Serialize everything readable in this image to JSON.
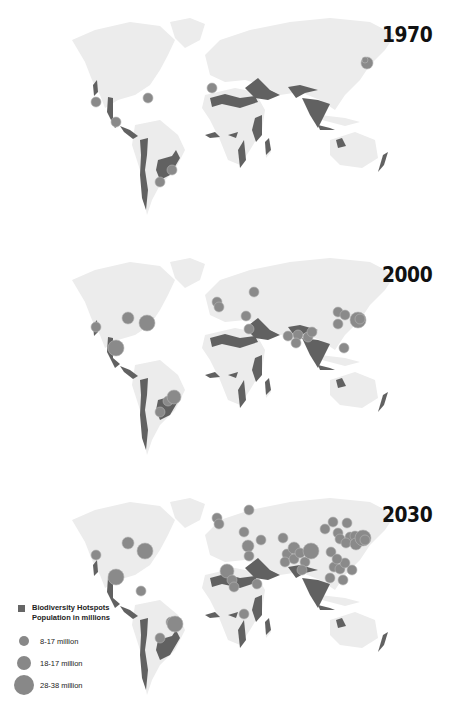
{
  "colors": {
    "land": "#ececec",
    "hotspot": "#616161",
    "circle": "#8a8a8a",
    "circle_stroke": "#b5b5b5",
    "year_text": "#111111"
  },
  "panels": [
    {
      "year": "1970",
      "top": 0,
      "circles": [
        [
          96,
          102,
          5
        ],
        [
          148,
          98,
          5
        ],
        [
          116,
          122,
          5
        ],
        [
          212,
          88,
          5
        ],
        [
          172,
          170,
          5
        ],
        [
          160,
          182,
          5
        ],
        [
          367,
          63,
          6
        ],
        [
          365,
          60,
          3
        ]
      ]
    },
    {
      "year": "2000",
      "top": 240,
      "circles": [
        [
          96,
          87,
          5
        ],
        [
          128,
          78,
          6
        ],
        [
          147,
          83,
          8
        ],
        [
          116,
          108,
          8
        ],
        [
          168,
          161,
          5
        ],
        [
          174,
          157,
          7
        ],
        [
          160,
          172,
          5
        ],
        [
          217,
          62,
          5
        ],
        [
          219,
          67,
          5
        ],
        [
          254,
          52,
          5
        ],
        [
          246,
          76,
          5
        ],
        [
          249,
          89,
          5
        ],
        [
          288,
          96,
          5
        ],
        [
          298,
          95,
          5
        ],
        [
          296,
          103,
          5
        ],
        [
          308,
          97,
          5
        ],
        [
          338,
          72,
          5
        ],
        [
          345,
          75,
          5
        ],
        [
          338,
          84,
          5
        ],
        [
          358,
          80,
          8
        ],
        [
          360,
          79,
          5
        ],
        [
          344,
          108,
          5
        ],
        [
          312,
          92,
          5
        ]
      ]
    },
    {
      "year": "2030",
      "top": 480,
      "circles": [
        [
          96,
          75,
          5
        ],
        [
          128,
          63,
          6
        ],
        [
          145,
          71,
          8
        ],
        [
          116,
          97,
          8
        ],
        [
          141,
          111,
          5
        ],
        [
          171,
          142,
          5
        ],
        [
          175,
          144,
          8
        ],
        [
          160,
          158,
          5
        ],
        [
          217,
          38,
          5
        ],
        [
          219,
          44,
          5
        ],
        [
          249,
          30,
          5
        ],
        [
          244,
          52,
          5
        ],
        [
          248,
          66,
          6
        ],
        [
          249,
          76,
          5
        ],
        [
          227,
          91,
          7
        ],
        [
          232,
          100,
          5
        ],
        [
          234,
          107,
          5
        ],
        [
          244,
          134,
          5
        ],
        [
          257,
          104,
          5
        ],
        [
          261,
          60,
          5
        ],
        [
          283,
          58,
          5
        ],
        [
          287,
          74,
          5
        ],
        [
          285,
          82,
          5
        ],
        [
          294,
          68,
          6
        ],
        [
          294,
          79,
          5
        ],
        [
          300,
          73,
          5
        ],
        [
          305,
          82,
          5
        ],
        [
          311,
          71,
          8
        ],
        [
          302,
          90,
          5
        ],
        [
          325,
          49,
          5
        ],
        [
          333,
          42,
          5
        ],
        [
          338,
          53,
          5
        ],
        [
          347,
          43,
          5
        ],
        [
          350,
          57,
          5
        ],
        [
          340,
          59,
          5
        ],
        [
          355,
          56,
          5
        ],
        [
          346,
          63,
          5
        ],
        [
          356,
          64,
          6
        ],
        [
          363,
          58,
          8
        ],
        [
          365,
          60,
          5
        ],
        [
          331,
          72,
          5
        ],
        [
          334,
          87,
          5
        ],
        [
          330,
          98,
          5
        ],
        [
          343,
          100,
          5
        ],
        [
          340,
          89,
          5
        ],
        [
          345,
          83,
          5
        ],
        [
          337,
          79,
          5
        ],
        [
          352,
          90,
          5
        ]
      ]
    }
  ],
  "legend": {
    "title_line1": "Biodiversity Hotspots",
    "title_line2": "Population in millions",
    "items": [
      {
        "label": "8-17 million",
        "size": 10
      },
      {
        "label": "18-17 million",
        "size": 14
      },
      {
        "label": "28-38 million",
        "size": 20
      }
    ]
  }
}
